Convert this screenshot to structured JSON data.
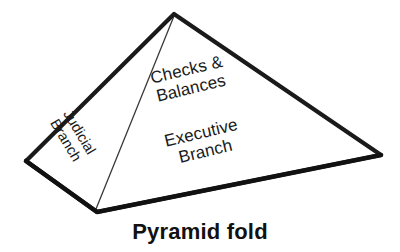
{
  "figure": {
    "type": "pyramid-fold-diagram",
    "caption": "Pyramid fold",
    "outline_color": "#1a1a1a",
    "fill_color": "#ffffff",
    "fold_line_color": "#3a3a3a",
    "background_color": "#ffffff",
    "vertices": {
      "apex": [
        174,
        14
      ],
      "left": [
        26,
        161
      ],
      "bottom": [
        97,
        212
      ],
      "right": [
        381,
        155
      ]
    },
    "faces": [
      {
        "name": "left-face",
        "label_lines": [
          "Judicial",
          "Branch"
        ],
        "rotation_deg": 59
      },
      {
        "name": "right-face",
        "label_lines": [
          "Checks &",
          "Balances",
          "Executive",
          "Branch"
        ],
        "rotation_deg": -13.5
      }
    ],
    "labels": {
      "judicial": {
        "line1": "Judicial",
        "line2": "Branch"
      },
      "checks": {
        "line1": "Checks &",
        "line2": "Balances"
      },
      "executive": {
        "line1": "Executive",
        "line2": "Branch"
      }
    }
  }
}
